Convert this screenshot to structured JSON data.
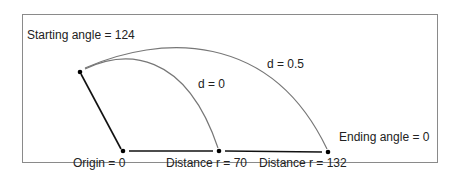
{
  "diagram": {
    "labels": {
      "starting_angle": "Starting angle = 124",
      "ending_angle": "Ending angle = 0",
      "origin": "Origin = 0",
      "distance_70": "Distance r = 70",
      "distance_132": "Distance r = 132",
      "curve_d0": "d = 0",
      "curve_d05": "d = 0.5"
    },
    "points": {
      "start": [
        80,
        72
      ],
      "origin": [
        123,
        151
      ],
      "r70": [
        219,
        151
      ],
      "r132": [
        328,
        152
      ]
    },
    "colors": {
      "frame": "#888888",
      "curve": "#777777",
      "line": "#111111"
    }
  }
}
